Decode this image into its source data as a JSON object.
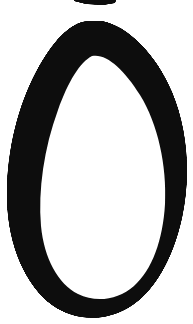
{
  "image": {
    "kind": "scanned-handwriting",
    "subject": "handwritten digit",
    "character": "0",
    "character_name": "zero",
    "width_px": 193,
    "height_px": 324,
    "background_color": "#ffffff",
    "ink_color": "#0d0d0d",
    "stroke_style": "thick marker loop, single closed stroke",
    "alt_text": "A large hand-drawn black digit zero shaped like a teardrop loop on a white background, with a small clipped ink mark at the top edge."
  },
  "strokes": {
    "main_loop": {
      "name": "teardrop-loop",
      "description": "Closed loop, pointed apex at top-center, widest and rounded at the bottom",
      "outer_path": "M 88 21 C 70 22 52 42 36 72 C 18 106 6 152 7 200 C 8 246 26 286 52 305 C 74 321 104 322 128 308 C 154 293 173 259 182 218 C 191 176 188 130 172 92 C 156 54 128 26 102 21 Z",
      "inner_path": "M 92 56 C 80 62 68 82 58 110 C 44 148 38 190 41 226 C 44 258 58 284 78 294 C 96 303 118 300 134 286 C 152 270 163 240 165 204 C 167 166 158 124 140 95 C 124 69 106 53 92 56 Z",
      "outer_bbox": [
        5,
        20,
        186,
        317
      ],
      "inner_bbox": [
        38,
        53,
        167,
        303
      ],
      "apex_point": [
        88,
        21
      ],
      "stroke_thickness_px": 33
    },
    "top_fragment": {
      "name": "clipped-ink-mark",
      "description": "Thin dark sliver clipped by the top edge of the scan",
      "path": "M 74 -4 L 117 -3 L 115 3 L 103 5 L 86 4 L 74 1 Z",
      "bbox": [
        74,
        0,
        117,
        5
      ]
    }
  },
  "colors": {
    "ink": "#0d0d0d",
    "paper": "#ffffff",
    "ink_soft_edge": "#1a1a1a"
  }
}
